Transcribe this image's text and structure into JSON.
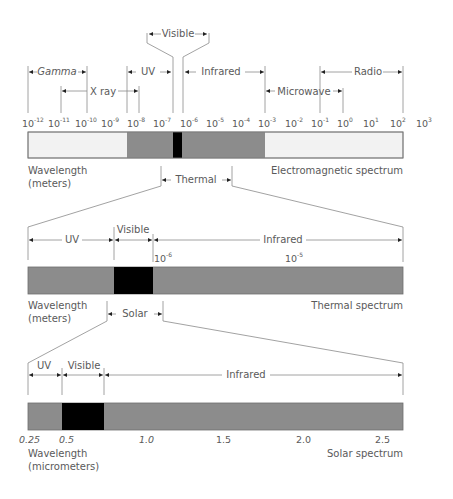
{
  "em_spectrum": {
    "title": "Electromagnetic spectrum",
    "axis_label_line1": "Wavelength",
    "axis_label_line2": "(meters)",
    "ticks": [
      {
        "base": "10",
        "exp": "-12"
      },
      {
        "base": "10",
        "exp": "-11"
      },
      {
        "base": "10",
        "exp": "-10"
      },
      {
        "base": "10",
        "exp": "-9"
      },
      {
        "base": "10",
        "exp": "-8"
      },
      {
        "base": "10",
        "exp": "-7"
      },
      {
        "base": "10",
        "exp": "-6"
      },
      {
        "base": "10",
        "exp": "-5"
      },
      {
        "base": "10",
        "exp": "-4"
      },
      {
        "base": "10",
        "exp": "-3"
      },
      {
        "base": "10",
        "exp": "-2"
      },
      {
        "base": "10",
        "exp": "-1"
      },
      {
        "base": "10",
        "exp": "0"
      },
      {
        "base": "10",
        "exp": "1"
      },
      {
        "base": "10",
        "exp": "2"
      },
      {
        "base": "10",
        "exp": "3"
      }
    ],
    "bands": {
      "gamma": "Gamma",
      "xray": "X ray",
      "uv": "UV",
      "visible": "Visible",
      "infrared": "Infrared",
      "microwave": "Microwave",
      "radio": "Radio"
    },
    "zoom_label": "Thermal"
  },
  "thermal_spectrum": {
    "title": "Thermal spectrum",
    "axis_label_line1": "Wavelength",
    "axis_label_line2": "(meters)",
    "ticks": [
      {
        "base": "10",
        "exp": "-6"
      },
      {
        "base": "10",
        "exp": "-5"
      }
    ],
    "bands": {
      "uv": "UV",
      "visible": "Visible",
      "infrared": "Infrared"
    },
    "zoom_label": "Solar"
  },
  "solar_spectrum": {
    "title": "Solar spectrum",
    "axis_label_line1": "Wavelength",
    "axis_label_line2": "(micrometers)",
    "ticks": [
      "0.25",
      "0.5",
      "1.0",
      "1.5",
      "2.0",
      "2.5"
    ],
    "bands": {
      "uv": "UV",
      "visible": "Visible",
      "infrared": "Infrared"
    }
  },
  "colors": {
    "bar_gray": "#8c8c8c",
    "bar_light": "#f2f2f2",
    "visible_black": "#000000",
    "line": "#8a8a8a",
    "text": "#5a5a5a"
  }
}
